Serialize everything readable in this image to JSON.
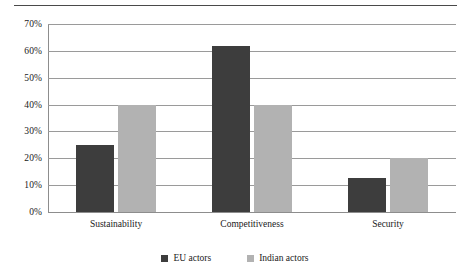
{
  "chart_data": {
    "type": "bar",
    "title": "",
    "subtitle": "",
    "xlabel": "",
    "ylabel": "",
    "categories": [
      "Sustainability",
      "Competitiveness",
      "Security"
    ],
    "series": [
      {
        "name": "EU actors",
        "values": [
          25,
          62,
          12.5
        ],
        "color": "#3d3d3d"
      },
      {
        "name": "Indian actors",
        "values": [
          40,
          40,
          20
        ],
        "color": "#b2b2b2"
      }
    ],
    "ylim": [
      0,
      70
    ],
    "ytick_step": 10,
    "ytick_labels": [
      "0%",
      "10%",
      "20%",
      "30%",
      "40%",
      "50%",
      "60%",
      "70%"
    ],
    "ytick_values": [
      0,
      10,
      20,
      30,
      40,
      50,
      60,
      70
    ],
    "grid": true,
    "grid_axis": "y",
    "legend": [
      "EU actors",
      "Indian actors"
    ],
    "legend_position": "bottom",
    "value_unit": "%"
  },
  "colors": {
    "eu_actors": "#3d3d3d",
    "indian_actors": "#b2b2b2",
    "gridline": "#9a9a9a",
    "axis": "#8d8d8d",
    "top_rule": "#4a4a4a",
    "background": "#ffffff",
    "text": "#1a1a1a"
  }
}
